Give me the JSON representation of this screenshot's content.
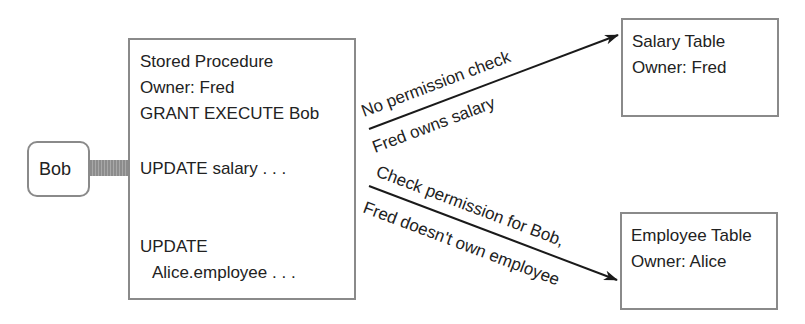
{
  "actor": {
    "label": "Bob"
  },
  "procedure": {
    "lines": [
      "Stored Procedure",
      "Owner: Fred",
      "GRANT EXECUTE Bob"
    ],
    "statement1": "UPDATE salary . . .",
    "statement2_line1": "UPDATE",
    "statement2_line2": "Alice.employee . . ."
  },
  "salary_table": {
    "title": "Salary Table",
    "owner": "Owner: Fred"
  },
  "employee_table": {
    "title": "Employee Table",
    "owner": "Owner: Alice"
  },
  "arrows": {
    "to_salary": {
      "above": "No permission check",
      "below": "Fred owns salary"
    },
    "to_employee": {
      "above": "Check permission for Bob,",
      "below": "Fred doesn't own employee"
    }
  },
  "colors": {
    "border": "#8a8a8a",
    "connector": "#9a9a9a",
    "arrow": "#1a1a1a"
  }
}
